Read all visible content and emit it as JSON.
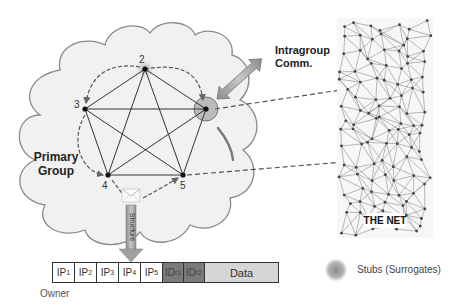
{
  "diagram": {
    "cloud_label": "Primary\nGroup",
    "cloud_label_lines": [
      "Primary",
      "Group"
    ],
    "intragroup_label_lines": [
      "Intragroup",
      "Comm."
    ],
    "structure_label": "Structure",
    "net_label": "THE NET",
    "nodes": [
      {
        "id": "1",
        "label": "",
        "x": 206,
        "y": 109,
        "has_surrogate_ring": true
      },
      {
        "id": "2",
        "label": "2",
        "x": 145,
        "y": 69,
        "has_stub_glow": true
      },
      {
        "id": "3",
        "label": "3",
        "x": 85,
        "y": 109
      },
      {
        "id": "4",
        "label": "4",
        "x": 108,
        "y": 175
      },
      {
        "id": "5",
        "label": "5",
        "x": 183,
        "y": 175
      }
    ],
    "packet": {
      "owner_label": "Owner",
      "cells": [
        {
          "type": "ip",
          "base": "IP",
          "sub": "1"
        },
        {
          "type": "ip",
          "base": "IP",
          "sub": "2"
        },
        {
          "type": "ip",
          "base": "IP",
          "sub": "3"
        },
        {
          "type": "ip",
          "base": "IP",
          "sub": "4"
        },
        {
          "type": "ip",
          "base": "IP",
          "sub": "5"
        },
        {
          "type": "id",
          "base": "ID",
          "sub": "r1"
        },
        {
          "type": "id",
          "base": "ID",
          "sub": "r2"
        },
        {
          "type": "data",
          "base": "Data",
          "sub": ""
        }
      ]
    },
    "legend": {
      "stub_label": "Stubs (Surrogates)"
    },
    "colors": {
      "cloud_fill": "#f1f1f1",
      "cloud_stroke": "#8a8a8a",
      "edge": "#333333",
      "dashed": "#555555",
      "arrow_fill": "#a9a9a9",
      "stub": "#9a9a9a",
      "id_cell": "#7a7a7a",
      "data_cell": "#d6d6d6"
    }
  }
}
